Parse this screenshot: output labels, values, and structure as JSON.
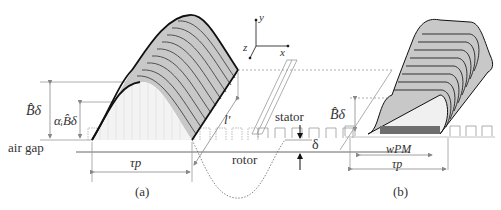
{
  "figure": {
    "type": "technical-diagram",
    "panels": [
      {
        "id": "a",
        "caption": "(a)",
        "shape": "sinusoidal",
        "labels": {
          "peak_flux": "B̂δ",
          "avg_flux": "αᵢB̂δ",
          "air_gap": "air gap",
          "pole_pitch": "τp",
          "length": "l'",
          "stator": "stator",
          "rotor": "rotor",
          "gap_width": "δ"
        },
        "axes": {
          "x": "x",
          "y": "y",
          "z": "z"
        }
      },
      {
        "id": "b",
        "caption": "(b)",
        "shape": "flat-top",
        "labels": {
          "peak_flux": "B̂δ",
          "magnet_width": "wPM",
          "pole_pitch": "τp"
        }
      }
    ],
    "colors": {
      "surface_fill": "#c8c8c8",
      "outline": "#222222",
      "guide": "#999999",
      "magnet": "#6e6e6e"
    }
  }
}
